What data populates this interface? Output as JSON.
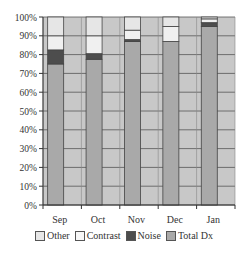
{
  "chart_data": {
    "type": "bar",
    "stacked": true,
    "percent": true,
    "title": "",
    "xlabel": "",
    "ylabel": "",
    "categories": [
      "Sep",
      "Oct",
      "Nov",
      "Dec",
      "Jan"
    ],
    "series": [
      {
        "name": "Total Dx",
        "color": "#a9a9a9",
        "values": [
          75,
          77.5,
          87,
          87,
          95
        ]
      },
      {
        "name": "Noise",
        "color": "#4d4d4d",
        "values": [
          7.5,
          3,
          1,
          0,
          2
        ]
      },
      {
        "name": "Contrast",
        "color": "#f0f0f0",
        "values": [
          7.5,
          9.5,
          5,
          8,
          2
        ]
      },
      {
        "name": "Other",
        "color": "#e6e6e6",
        "values": [
          10,
          10,
          7,
          5,
          1
        ]
      }
    ],
    "y_ticks": [
      "0%",
      "10%",
      "20%",
      "30%",
      "40%",
      "50%",
      "60%",
      "70%",
      "80%",
      "90%",
      "100%"
    ],
    "ylim": [
      0,
      100
    ],
    "grid": true,
    "plot_background": "#c8c8c8",
    "legend_position": "bottom",
    "legend_order": [
      "Other",
      "Contrast",
      "Noise",
      "Total Dx"
    ]
  },
  "legend": {
    "items": [
      {
        "label": "Other",
        "color": "#e6e6e6"
      },
      {
        "label": "Contrast",
        "color": "#f7f7f7"
      },
      {
        "label": "Noise",
        "color": "#4d4d4d"
      },
      {
        "label": "Total Dx",
        "color": "#a9a9a9"
      }
    ]
  }
}
